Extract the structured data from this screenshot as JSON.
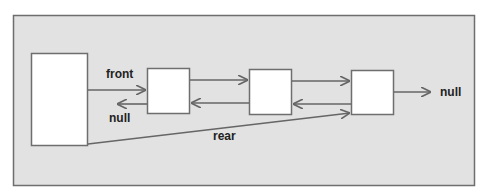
{
  "diagram": {
    "type": "doubly-linked-list-queue",
    "colors": {
      "panel_bg": "#e2e2e2",
      "panel_border": "#6e6e6e",
      "box_fill": "#ffffff",
      "line": "#666666",
      "text": "#222222"
    },
    "header_box": {
      "label": ""
    },
    "nodes": [
      {
        "label": ""
      },
      {
        "label": ""
      },
      {
        "label": ""
      }
    ],
    "labels": {
      "front": "front",
      "rear": "rear",
      "null_left": "null",
      "null_right": "null"
    }
  }
}
